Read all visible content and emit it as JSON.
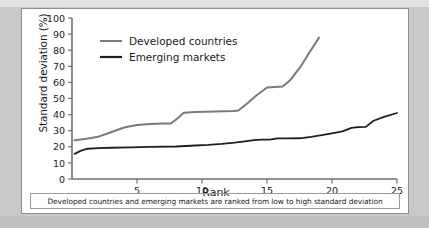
{
  "figure": {
    "caption": "Developed countries and emerging markets are ranked from low to high standard deviation"
  },
  "chart_data": {
    "type": "line",
    "title": "",
    "subtitle": "",
    "xlabel": "Rank",
    "ylabel": "Standard deviation (%)",
    "xlim": [
      0,
      25
    ],
    "ylim": [
      0,
      100
    ],
    "xticks": [
      5,
      10,
      15,
      20,
      25
    ],
    "xtick_labels": [
      "5",
      "10",
      "15",
      "20",
      "25"
    ],
    "yticks": [
      0,
      10,
      20,
      30,
      40,
      50,
      60,
      70,
      80,
      90,
      100
    ],
    "ytick_labels": [
      "0",
      "10",
      "20",
      "30",
      "40",
      "50",
      "60",
      "70",
      "80",
      "90",
      "100"
    ],
    "grid": false,
    "legend_position": "upper-left-inside",
    "annotation": "Developed countries and emerging markets are ranked from low to high standard deviation",
    "series": [
      {
        "name": "Developed countries",
        "color": "#7a7a78",
        "width": 2.0,
        "x": [
          0.2,
          1.0,
          2.0,
          3.0,
          4.0,
          5.0,
          6.0,
          7.0,
          7.6,
          8.1,
          8.6,
          9.5,
          11.0,
          12.4,
          12.8,
          13.5,
          14.2,
          15.0,
          15.6,
          16.2,
          16.8,
          17.6,
          18.3,
          19.0
        ],
        "y": [
          24.0,
          24.8,
          26.2,
          29.0,
          32.0,
          33.6,
          34.2,
          34.4,
          34.5,
          37.5,
          41.2,
          41.6,
          42.0,
          42.3,
          42.5,
          47.0,
          52.0,
          56.8,
          57.2,
          57.5,
          61.5,
          70.0,
          79.0,
          87.8
        ]
      },
      {
        "name": "Emerging markets",
        "color": "#1f1f1f",
        "width": 1.8,
        "x": [
          0.2,
          0.7,
          1.2,
          2.0,
          3.0,
          4.5,
          6.0,
          8.0,
          9.5,
          10.5,
          11.5,
          12.5,
          13.3,
          14.0,
          14.6,
          15.2,
          15.8,
          16.6,
          17.5,
          18.4,
          19.2,
          20.0,
          20.8,
          21.5,
          22.0,
          22.6,
          23.2,
          24.0,
          25.0
        ],
        "y": [
          15.6,
          17.6,
          18.8,
          19.2,
          19.4,
          19.7,
          19.9,
          20.2,
          20.8,
          21.2,
          21.8,
          22.6,
          23.4,
          24.2,
          24.4,
          24.4,
          25.2,
          25.2,
          25.3,
          26.2,
          27.2,
          28.4,
          29.6,
          31.8,
          32.2,
          32.4,
          36.2,
          38.6,
          41.0
        ]
      }
    ]
  },
  "legend": {
    "entries": [
      {
        "label": "Developed countries",
        "color": "#7a7a78"
      },
      {
        "label": "Emerging markets",
        "color": "#1f1f1f"
      }
    ]
  }
}
